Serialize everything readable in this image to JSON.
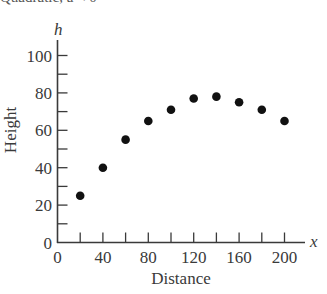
{
  "header": {
    "cropped_title": "Quadratic, a < 0"
  },
  "chart_data": {
    "type": "scatter",
    "title": "",
    "xlabel": "Distance",
    "ylabel": "Height",
    "x_variable": "x",
    "y_variable": "h",
    "xlim": [
      0,
      215
    ],
    "ylim": [
      0,
      105
    ],
    "x_ticks": [
      0,
      40,
      80,
      120,
      160,
      200
    ],
    "x_minor_ticks": [
      20,
      40,
      60,
      80,
      100,
      120,
      140,
      160,
      180,
      200
    ],
    "y_ticks": [
      0,
      20,
      40,
      60,
      80,
      100
    ],
    "y_minor_ticks": [
      10,
      30,
      50,
      70,
      90
    ],
    "grid": false,
    "legend": null,
    "series": [
      {
        "name": "Height vs Distance",
        "color": "#111111",
        "x": [
          20,
          40,
          60,
          80,
          100,
          120,
          140,
          160,
          180,
          200
        ],
        "y": [
          25,
          40,
          55,
          65,
          71,
          77,
          78,
          75,
          71,
          65
        ]
      }
    ]
  },
  "colors": {
    "axis": "#3a3a3a",
    "points": "#111111",
    "background": "#ffffff"
  }
}
